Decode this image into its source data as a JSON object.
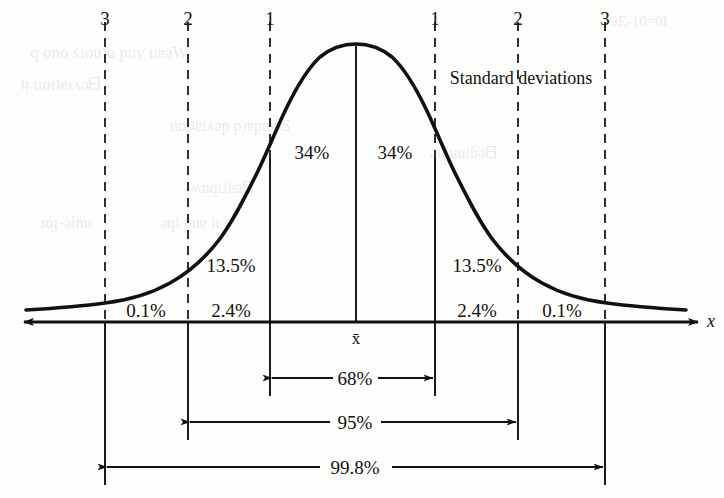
{
  "figure": {
    "axis_label_x": "x",
    "mean_label": "x̄",
    "standard_deviations_label": "Standard deviations",
    "sd_ticks": [
      {
        "label": "3",
        "x": 105,
        "sigma": -3
      },
      {
        "label": "2",
        "x": 188,
        "sigma": -2
      },
      {
        "label": "1",
        "x": 270,
        "sigma": -1
      },
      {
        "label": "1",
        "x": 435,
        "sigma": 1
      },
      {
        "label": "2",
        "x": 518,
        "sigma": 2
      },
      {
        "label": "3",
        "x": 600,
        "sigma": 3
      }
    ],
    "region_labels": [
      {
        "text": "0.1%",
        "x": 146,
        "y": 310
      },
      {
        "text": "2.4%",
        "x": 229,
        "y": 310
      },
      {
        "text": "13.5%",
        "x": 229,
        "y": 265
      },
      {
        "text": "34%",
        "x": 312,
        "y": 152
      },
      {
        "text": "34%",
        "x": 395,
        "y": 152
      },
      {
        "text": "13.5%",
        "x": 479,
        "y": 265
      },
      {
        "text": "2.4%",
        "x": 479,
        "y": 310
      },
      {
        "text": "0.1%",
        "x": 562,
        "y": 310
      }
    ],
    "span_arrows": [
      {
        "text": "68%",
        "x1": 270,
        "x2": 435,
        "y": 378
      },
      {
        "text": "95%",
        "x1": 188,
        "x2": 518,
        "y": 422
      },
      {
        "text": "99.8%",
        "x1": 105,
        "x2": 605,
        "y": 467
      }
    ],
    "colors": {
      "ink": "#111111",
      "paper": "#fdfdfb",
      "dashed": "#1a1a1a"
    }
  },
  "ghost_text": [
    {
      "text": "9E-10=0I",
      "x": 610,
      "y": 14,
      "size": 15
    },
    {
      "text": "q ono sɹouʇo puv uɐǝW",
      "x": 30,
      "y": 44,
      "size": 17
    },
    {
      "text": "ʇᴉ uoıʇɐıʌǝᗺ",
      "x": 20,
      "y": 76,
      "size": 17
    },
    {
      "text": "uoıʇɐıʌǝp pɹɐpuɐʇS",
      "x": 170,
      "y": 118,
      "size": 16
    },
    {
      "text": "ʍnqıɹʇsıᗺ",
      "x": 190,
      "y": 180,
      "size": 16
    },
    {
      "text": "ɹoɟ-ǝlnu",
      "x": 40,
      "y": 215,
      "size": 16
    },
    {
      "text": "ǝɥʇ puɐ ʇı",
      "x": 160,
      "y": 215,
      "size": 16
    },
    {
      "text": "ǝuıuuıɓǝᗺ",
      "x": 430,
      "y": 145,
      "size": 16
    }
  ],
  "chart_data": {
    "type": "line",
    "title": "",
    "subtitle": "",
    "xlabel": "x",
    "ylabel": "",
    "x": [
      -3,
      -2,
      -1,
      0,
      1,
      2,
      3
    ],
    "xticklabels": [
      "3",
      "2",
      "1",
      "x̄",
      "1",
      "2",
      "3"
    ],
    "xlim": [
      -4.2,
      4.2
    ],
    "grid": false,
    "legend": null,
    "series": [
      {
        "name": "normal density",
        "kind": "curve",
        "formula": "standard normal probability density"
      }
    ],
    "band_percentages": [
      {
        "band": "below -3 sd",
        "value": 0.1,
        "label": "0.1%"
      },
      {
        "band": "-3 sd to -2 sd",
        "value": 2.4,
        "label": "2.4%"
      },
      {
        "band": "-2 sd to -1 sd",
        "value": 13.5,
        "label": "13.5%"
      },
      {
        "band": "-1 sd to mean",
        "value": 34,
        "label": "34%"
      },
      {
        "band": "mean to +1 sd",
        "value": 34,
        "label": "34%"
      },
      {
        "band": "+1 sd to +2 sd",
        "value": 13.5,
        "label": "13.5%"
      },
      {
        "band": "+2 sd to +3 sd",
        "value": 2.4,
        "label": "2.4%"
      },
      {
        "band": "above +3 sd",
        "value": 0.1,
        "label": "0.1%"
      }
    ],
    "cumulative_spans": [
      {
        "span": "±1 sd",
        "value": 68,
        "label": "68%"
      },
      {
        "span": "±2 sd",
        "value": 95,
        "label": "95%"
      },
      {
        "span": "±3 sd",
        "value": 99.8,
        "label": "99.8%"
      }
    ]
  }
}
